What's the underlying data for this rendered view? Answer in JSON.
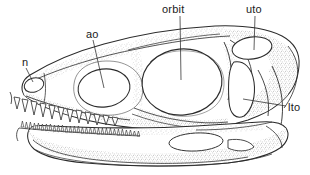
{
  "figure": {
    "kind": "anatomical-line-drawing",
    "background_color": "#ffffff",
    "ink_color": "#2b2b2b",
    "fill_color": "#ffffff",
    "stipple_color": "#8d8d8d"
  },
  "labels": [
    {
      "id": "n",
      "text": "n",
      "meaning": "external naris"
    },
    {
      "id": "ao",
      "text": "ao",
      "meaning": "antorbital fenestra"
    },
    {
      "id": "orbit",
      "text": "orbit",
      "meaning": "orbit"
    },
    {
      "id": "uto",
      "text": "uto",
      "meaning": "upper temporal opening"
    },
    {
      "id": "lto",
      "text": "lto",
      "meaning": "lower temporal opening"
    }
  ],
  "openings": [
    {
      "id": "naris",
      "label": "n"
    },
    {
      "id": "antorbital-fenestra",
      "label": "ao"
    },
    {
      "id": "orbit",
      "label": "orbit"
    },
    {
      "id": "upper-temporal",
      "label": "uto"
    },
    {
      "id": "lower-temporal",
      "label": "lto"
    },
    {
      "id": "mandibular-fenestra",
      "label": ""
    }
  ],
  "dentition": {
    "upper_tooth_count": 12,
    "lower_tooth_count": 30,
    "upper_tooth_shape": "large recurved triangular",
    "lower_tooth_shape": "small closely-packed triangular"
  }
}
